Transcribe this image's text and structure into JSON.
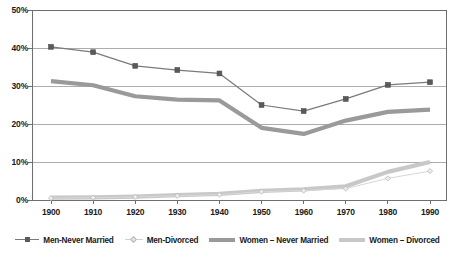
{
  "chart_data": {
    "type": "line",
    "title": "",
    "xlabel": "",
    "ylabel": "",
    "categories": [
      1900,
      1910,
      1920,
      1930,
      1940,
      1950,
      1960,
      1970,
      1980,
      1990
    ],
    "xtick_labels": [
      "1900",
      "1910",
      "1920",
      "1930",
      "1940",
      "1950",
      "1960",
      "1970",
      "1980",
      "1990"
    ],
    "ytick_labels": [
      "0%",
      "10%",
      "20%",
      "30%",
      "40%",
      "50%"
    ],
    "ytick_values": [
      0,
      10,
      20,
      30,
      40,
      50
    ],
    "ylim": [
      0,
      50
    ],
    "grid": true,
    "legend_position": "bottom",
    "series": [
      {
        "name": "Men-Never Married",
        "color": "#7a7a7a",
        "marker": "square",
        "marker_color": "#5a5a5a",
        "values": [
          40.3,
          38.9,
          35.3,
          34.2,
          33.3,
          25.0,
          23.4,
          26.6,
          30.3,
          31.0
        ]
      },
      {
        "name": "Men-Divorced",
        "color": "#d8d8d8",
        "marker": "diamond",
        "marker_color": "#ededed",
        "values": [
          0.5,
          0.6,
          0.8,
          1.1,
          1.4,
          2.2,
          2.5,
          3.0,
          5.7,
          7.6
        ]
      },
      {
        "name": "Women – Never Married",
        "color": "#9a9a9a",
        "marker": "none",
        "marker_color": "#9a9a9a",
        "values": [
          31.3,
          30.2,
          27.3,
          26.4,
          26.2,
          19.0,
          17.4,
          20.9,
          23.2,
          23.8
        ]
      },
      {
        "name": "Women – Divorced",
        "color": "#c8c8c8",
        "marker": "none",
        "marker_color": "#c8c8c8",
        "values": [
          0.6,
          0.7,
          0.9,
          1.3,
          1.6,
          2.4,
          2.8,
          3.6,
          7.4,
          10.0
        ]
      }
    ]
  },
  "legend": {
    "items": [
      {
        "label": "Men-Never Married"
      },
      {
        "label": "Men-Divorced"
      },
      {
        "label": "Women – Never Married"
      },
      {
        "label": "Women – Divorced"
      }
    ]
  }
}
